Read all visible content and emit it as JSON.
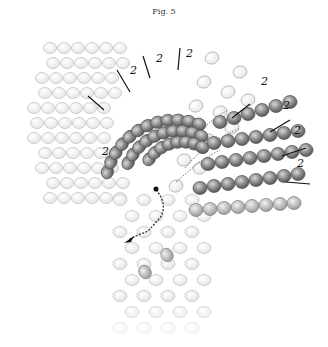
{
  "figure": {
    "title": "Fig. 5",
    "step_labels": [
      {
        "text": "2",
        "x": 102,
        "y": 155
      },
      {
        "text": "2",
        "x": 130,
        "y": 74
      },
      {
        "text": "2",
        "x": 156,
        "y": 62
      },
      {
        "text": "2",
        "x": 186,
        "y": 57
      },
      {
        "text": "2",
        "x": 261,
        "y": 85
      },
      {
        "text": "2",
        "x": 283,
        "y": 109
      },
      {
        "text": "2",
        "x": 294,
        "y": 134
      },
      {
        "text": "2",
        "x": 297,
        "y": 167
      }
    ],
    "colors": {
      "active_bead": "#8a8a8a",
      "active_bead_edge": "#5a5a5a",
      "faint_bead": "#dcdcdc",
      "faint_bead_edge": "#c4c4c4",
      "thread": "#333333"
    }
  }
}
